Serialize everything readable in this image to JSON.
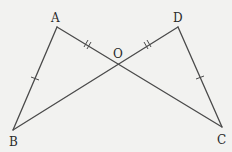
{
  "diagram": {
    "type": "geometry",
    "background": "#f2f2f0",
    "stroke_color": "#4a4a4a",
    "points": {
      "A": {
        "label": "A",
        "x": 57,
        "y": 27
      },
      "D": {
        "label": "D",
        "x": 178,
        "y": 27
      },
      "O": {
        "label": "O",
        "x": 118,
        "y": 62
      },
      "B": {
        "label": "B",
        "x": 13,
        "y": 130
      },
      "C": {
        "label": "C",
        "x": 222,
        "y": 127
      }
    },
    "segments": [
      "AB",
      "AC",
      "DB",
      "DC"
    ],
    "equal_marks": [
      {
        "segments": [
          "AB",
          "DC"
        ],
        "ticks": 1
      },
      {
        "segments": [
          "AO",
          "OD"
        ],
        "ticks": 2
      }
    ]
  }
}
